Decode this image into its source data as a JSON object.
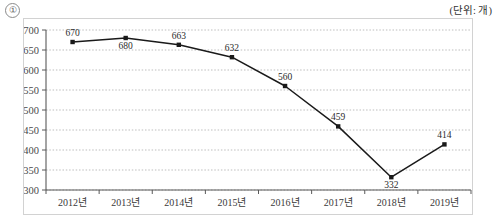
{
  "header": {
    "marker": "①",
    "unit_label": "(단위: 개)"
  },
  "chart_data": {
    "type": "line",
    "title": "",
    "subtitle": "",
    "xlabel": "",
    "ylabel": "",
    "unit": "(단위: 개)",
    "categories": [
      "2012년",
      "2013년",
      "2014년",
      "2015년",
      "2016년",
      "2017년",
      "2018년",
      "2019년"
    ],
    "values": [
      670,
      680,
      663,
      632,
      560,
      459,
      332,
      414
    ],
    "series": [
      {
        "name": "",
        "values": [
          670,
          680,
          663,
          632,
          560,
          459,
          332,
          414
        ]
      }
    ],
    "data_labels": [
      "670",
      "680",
      "663",
      "632",
      "560",
      "459",
      "332",
      "414"
    ],
    "label_positions": [
      "above",
      "below",
      "above",
      "above",
      "above",
      "above",
      "below",
      "above"
    ],
    "ylim": [
      300,
      700
    ],
    "yticks": [
      300,
      350,
      400,
      450,
      500,
      550,
      600,
      650,
      700
    ],
    "ytick_labels": [
      "300",
      "350",
      "400",
      "450",
      "500",
      "550",
      "600",
      "650",
      "700"
    ],
    "grid": true,
    "grid_style": "dotted",
    "legend": "none",
    "line_color": "#1a1a1a",
    "marker_color": "#1a1a1a",
    "grid_color": "#bdbdbd",
    "axis_color": "#595959"
  }
}
